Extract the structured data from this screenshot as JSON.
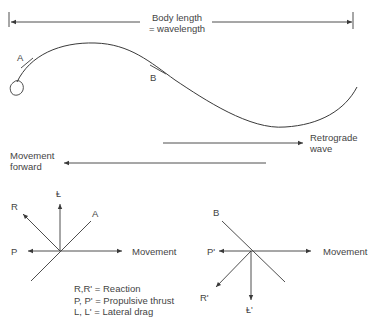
{
  "diagram": {
    "top_dimension": {
      "label_line1": "Body length",
      "label_line2": "= wavelength"
    },
    "body_points": {
      "a": "A",
      "b": "B"
    },
    "arrows": {
      "retrograde_line1": "Retrograde",
      "retrograde_line2": "wave",
      "movement_line1": "Movement",
      "movement_line2": "forward"
    },
    "vector_diagram_a": {
      "r": "R",
      "l": "Ⱡ",
      "a": "A",
      "p": "P",
      "movement": "Movement"
    },
    "vector_diagram_b": {
      "b": "B",
      "p": "P'",
      "movement": "Movement",
      "r": "R'",
      "l": "Ⱡ'"
    },
    "legend": [
      "R,R' = Reaction",
      "P, P' = Propulsive thrust",
      "L, L' = Lateral drag"
    ],
    "colors": {
      "line": "#3a3a3a",
      "text": "#444444"
    }
  }
}
